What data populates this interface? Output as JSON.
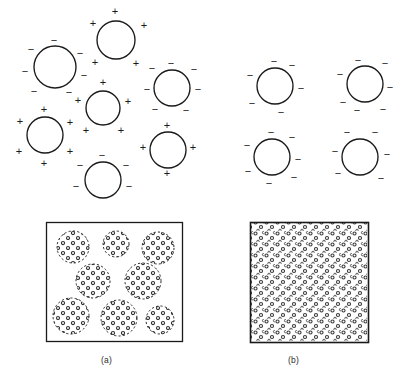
{
  "figure": {
    "width": 408,
    "height": 382,
    "background": "#ffffff",
    "ink_color": "#1a1a1a",
    "line_width": 1.1
  },
  "captions": {
    "panel_a": "(a)",
    "panel_b": "(b)"
  },
  "symbols": {
    "positive": "+",
    "negative": "−",
    "positive_name": "plus-sign",
    "negative_name": "minus-sign"
  },
  "panel_a": {
    "label": "(a)",
    "description": "Mixed-charge droplets: some bearing net positive surface charge and some net negative surface charge",
    "droplets": [
      {
        "id": "a1",
        "cx": 55,
        "cy": 67,
        "r": 21,
        "charge": "negative",
        "signs": [
          {
            "t": "−",
            "x": 54,
            "y": 41
          },
          {
            "t": "−",
            "x": 31,
            "y": 50
          },
          {
            "t": "−",
            "x": 80,
            "y": 54
          },
          {
            "t": "−",
            "x": 25,
            "y": 72
          },
          {
            "t": "−",
            "x": 84,
            "y": 76
          },
          {
            "t": "−",
            "x": 34,
            "y": 92
          },
          {
            "t": "−",
            "x": 69,
            "y": 93
          }
        ]
      },
      {
        "id": "a2",
        "cx": 116,
        "cy": 40,
        "r": 19,
        "charge": "positive",
        "signs": [
          {
            "t": "+",
            "x": 115,
            "y": 12
          },
          {
            "t": "+",
            "x": 93,
            "y": 24
          },
          {
            "t": "+",
            "x": 144,
            "y": 26
          },
          {
            "t": "+",
            "x": 95,
            "y": 63
          },
          {
            "t": "+",
            "x": 136,
            "y": 64
          }
        ]
      },
      {
        "id": "a3",
        "cx": 172,
        "cy": 88,
        "r": 18,
        "charge": "negative",
        "signs": [
          {
            "t": "−",
            "x": 171,
            "y": 64
          },
          {
            "t": "−",
            "x": 152,
            "y": 69
          },
          {
            "t": "−",
            "x": 194,
            "y": 70
          },
          {
            "t": "−",
            "x": 147,
            "y": 90
          },
          {
            "t": "−",
            "x": 198,
            "y": 90
          },
          {
            "t": "−",
            "x": 155,
            "y": 110
          },
          {
            "t": "−",
            "x": 186,
            "y": 111
          }
        ]
      },
      {
        "id": "a4",
        "cx": 103,
        "cy": 108,
        "r": 17,
        "charge": "positive",
        "signs": [
          {
            "t": "+",
            "x": 103,
            "y": 83
          },
          {
            "t": "+",
            "x": 78,
            "y": 101
          },
          {
            "t": "+",
            "x": 128,
            "y": 102
          },
          {
            "t": "+",
            "x": 86,
            "y": 131
          },
          {
            "t": "+",
            "x": 121,
            "y": 131
          }
        ]
      },
      {
        "id": "a5",
        "cx": 45,
        "cy": 135,
        "r": 18,
        "charge": "positive",
        "signs": [
          {
            "t": "+",
            "x": 44,
            "y": 110
          },
          {
            "t": "+",
            "x": 20,
            "y": 122
          },
          {
            "t": "+",
            "x": 70,
            "y": 123
          },
          {
            "t": "+",
            "x": 19,
            "y": 152
          },
          {
            "t": "+",
            "x": 70,
            "y": 152
          },
          {
            "t": "+",
            "x": 44,
            "y": 164
          }
        ]
      },
      {
        "id": "a6",
        "cx": 103,
        "cy": 180,
        "r": 18,
        "charge": "negative",
        "signs": [
          {
            "t": "−",
            "x": 102,
            "y": 156
          },
          {
            "t": "−",
            "x": 80,
            "y": 166
          },
          {
            "t": "−",
            "x": 126,
            "y": 166
          },
          {
            "t": "−",
            "x": 76,
            "y": 187
          },
          {
            "t": "−",
            "x": 129,
            "y": 187
          }
        ]
      },
      {
        "id": "a7",
        "cx": 168,
        "cy": 150,
        "r": 18,
        "charge": "positive",
        "signs": [
          {
            "t": "+",
            "x": 167,
            "y": 126
          },
          {
            "t": "+",
            "x": 143,
            "y": 148
          },
          {
            "t": "+",
            "x": 193,
            "y": 148
          },
          {
            "t": "+",
            "x": 167,
            "y": 174
          }
        ]
      }
    ],
    "box": {
      "x": 46,
      "y": 222,
      "width": 136,
      "height": 119,
      "fill": "#ffffff",
      "stroke": "#1a1a1a",
      "description": "Macroscopic appearance: discrete flocculated aggregates (separated speckled clusters)",
      "clusters": [
        {
          "cx": 73,
          "cy": 247,
          "r": 16
        },
        {
          "cx": 116,
          "cy": 244,
          "r": 13
        },
        {
          "cx": 158,
          "cy": 248,
          "r": 16
        },
        {
          "cx": 93,
          "cy": 281,
          "r": 17
        },
        {
          "cx": 143,
          "cy": 281,
          "r": 18
        },
        {
          "cx": 71,
          "cy": 316,
          "r": 18
        },
        {
          "cx": 119,
          "cy": 318,
          "r": 18
        },
        {
          "cx": 160,
          "cy": 320,
          "r": 14
        }
      ]
    }
  },
  "panel_b": {
    "label": "(b)",
    "description": "Uniformly negative droplets: all droplets carry like (negative) surface charge and repel",
    "droplets": [
      {
        "id": "b1",
        "cx": 275,
        "cy": 86,
        "r": 18,
        "charge": "negative",
        "signs": [
          {
            "t": "−",
            "x": 274,
            "y": 62
          },
          {
            "t": "−",
            "x": 292,
            "y": 66
          },
          {
            "t": "−",
            "x": 250,
            "y": 76
          },
          {
            "t": "−",
            "x": 301,
            "y": 89
          },
          {
            "t": "−",
            "x": 252,
            "y": 104
          },
          {
            "t": "−",
            "x": 281,
            "y": 113
          }
        ]
      },
      {
        "id": "b2",
        "cx": 365,
        "cy": 84,
        "r": 18,
        "charge": "negative",
        "signs": [
          {
            "t": "−",
            "x": 358,
            "y": 61
          },
          {
            "t": "−",
            "x": 385,
            "y": 64
          },
          {
            "t": "−",
            "x": 340,
            "y": 75
          },
          {
            "t": "−",
            "x": 390,
            "y": 88
          },
          {
            "t": "−",
            "x": 343,
            "y": 103
          },
          {
            "t": "−",
            "x": 357,
            "y": 111
          },
          {
            "t": "−",
            "x": 383,
            "y": 110
          }
        ]
      },
      {
        "id": "b3",
        "cx": 272,
        "cy": 157,
        "r": 18,
        "charge": "negative",
        "signs": [
          {
            "t": "−",
            "x": 271,
            "y": 133
          },
          {
            "t": "−",
            "x": 292,
            "y": 138
          },
          {
            "t": "−",
            "x": 247,
            "y": 146
          },
          {
            "t": "−",
            "x": 298,
            "y": 160
          },
          {
            "t": "−",
            "x": 248,
            "y": 172
          },
          {
            "t": "−",
            "x": 294,
            "y": 178
          },
          {
            "t": "−",
            "x": 269,
            "y": 184
          }
        ]
      },
      {
        "id": "b4",
        "cx": 360,
        "cy": 157,
        "r": 18,
        "charge": "negative",
        "signs": [
          {
            "t": "−",
            "x": 347,
            "y": 133
          },
          {
            "t": "−",
            "x": 375,
            "y": 133
          },
          {
            "t": "−",
            "x": 335,
            "y": 152
          },
          {
            "t": "−",
            "x": 387,
            "y": 155
          },
          {
            "t": "−",
            "x": 338,
            "y": 174
          },
          {
            "t": "−",
            "x": 381,
            "y": 179
          }
        ]
      }
    ],
    "box": {
      "x": 250,
      "y": 222,
      "width": 118,
      "height": 120,
      "fill": "#ffffff",
      "stroke": "#1a1a1a",
      "description": "Macroscopic appearance: uniform homogeneous dispersion (evenly speckled throughout)"
    }
  }
}
